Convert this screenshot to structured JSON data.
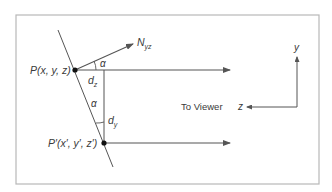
{
  "diagram": {
    "type": "geometry-projection",
    "frame": {
      "x": 16,
      "y": 15,
      "width": 303,
      "height": 169,
      "stroke": "#b8b8b8"
    },
    "colors": {
      "line": "#555555",
      "frame": "#b8b8b8",
      "text": "#3a3a3a",
      "point": "#111111"
    },
    "points": {
      "P": {
        "label": "P(x, y, z)",
        "x": 75,
        "y": 70
      },
      "P_prime": {
        "label": "P′(x′, y′, z′)",
        "x": 104,
        "y": 143
      }
    },
    "normal": {
      "label_main": "N",
      "label_sub": "yz",
      "from": [
        75,
        70
      ],
      "to": [
        133,
        44
      ]
    },
    "plane_line": {
      "from": [
        58,
        30
      ],
      "to": [
        113,
        167
      ]
    },
    "angles": {
      "alpha_top": "α",
      "alpha_bottom": "α"
    },
    "distances": {
      "dz": {
        "main": "d",
        "sub": "z"
      },
      "dy": {
        "main": "d",
        "sub": "y"
      }
    },
    "rays": [
      {
        "from": [
          75,
          70
        ],
        "to": [
          230,
          70
        ]
      },
      {
        "from": [
          104,
          143
        ],
        "to": [
          230,
          143
        ]
      }
    ],
    "axes": {
      "y_label": "y",
      "z_label": "z",
      "to_viewer": "To Viewer",
      "origin": [
        297,
        107
      ]
    }
  }
}
